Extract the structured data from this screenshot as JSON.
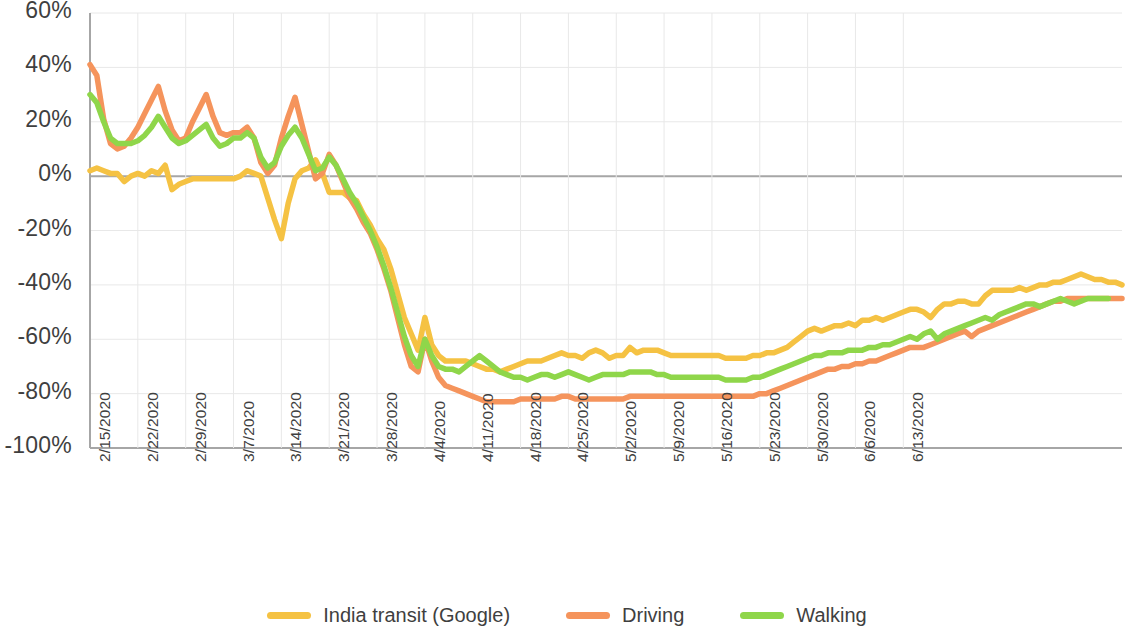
{
  "chart_data": {
    "type": "line",
    "title": "",
    "subtitle": "",
    "xlabel": "",
    "ylabel": "",
    "ylim": [
      -100,
      60
    ],
    "ytick_step": 20,
    "ytick_labels": [
      "60%",
      "40%",
      "20%",
      "0%",
      "-20%",
      "-40%",
      "-60%",
      "-80%",
      "-100%"
    ],
    "ytick_values": [
      60,
      40,
      20,
      0,
      -20,
      -40,
      -60,
      -80,
      -100
    ],
    "grid": true,
    "grid_color": "#e8e8e8",
    "zero_line_color": "#a6a6a6",
    "axis_color": "#a6a6a6",
    "legend_position": "bottom",
    "x_start_date": "2/15/2020",
    "x_end_date": "6/18/2020",
    "xtick_interval_days": 7,
    "xtick_labels": [
      "2/15/2020",
      "2/22/2020",
      "2/29/2020",
      "3/7/2020",
      "3/14/2020",
      "3/21/2020",
      "3/28/2020",
      "4/4/2020",
      "4/11/2020",
      "4/18/2020",
      "4/25/2020",
      "5/2/2020",
      "5/9/2020",
      "5/16/2020",
      "5/23/2020",
      "5/30/2020",
      "6/6/2020",
      "6/13/2020"
    ],
    "series": [
      {
        "name": "India transit (Google)",
        "color": "#F5C243",
        "values": [
          2,
          3,
          2,
          1,
          1,
          -2,
          0,
          1,
          0,
          2,
          1,
          4,
          -5,
          -3,
          -2,
          -1,
          -1,
          -1,
          -1,
          -1,
          -1,
          -1,
          0,
          2,
          1,
          0,
          -8,
          -16,
          -23,
          -10,
          -1,
          2,
          3,
          6,
          1,
          -6,
          -6,
          -6,
          -8,
          -9,
          -14,
          -18,
          -23,
          -27,
          -34,
          -43,
          -52,
          -58,
          -64,
          -52,
          -62,
          -66,
          -68,
          -68,
          -68,
          -68,
          -69,
          -70,
          -71,
          -71,
          -72,
          -71,
          -70,
          -69,
          -68,
          -68,
          -68,
          -67,
          -66,
          -65,
          -66,
          -66,
          -67,
          -65,
          -64,
          -65,
          -67,
          -66,
          -66,
          -63,
          -65,
          -64,
          -64,
          -64,
          -65,
          -66,
          -66,
          -66,
          -66,
          -66,
          -66,
          -66,
          -66,
          -67,
          -67,
          -67,
          -67,
          -66,
          -66,
          -65,
          -65,
          -64,
          -63,
          -61,
          -59,
          -57,
          -56,
          -57,
          -56,
          -55,
          -55,
          -54,
          -55,
          -53,
          -53,
          -52,
          -53,
          -52,
          -51,
          -50,
          -49,
          -49,
          -50,
          -52,
          -49,
          -47,
          -47,
          -46,
          -46,
          -47,
          -47,
          -44,
          -42,
          -42,
          -42,
          -42,
          -41,
          -42,
          -41,
          -40,
          -40,
          -39,
          -39,
          -38,
          -37,
          -36,
          -37,
          -38,
          -38,
          -39,
          -39,
          -40
        ]
      },
      {
        "name": "Driving",
        "color": "#F5945C",
        "values": [
          41,
          37,
          21,
          12,
          10,
          11,
          14,
          18,
          23,
          28,
          33,
          24,
          17,
          13,
          14,
          20,
          25,
          30,
          22,
          16,
          15,
          16,
          16,
          18,
          14,
          5,
          1,
          4,
          14,
          22,
          29,
          19,
          9,
          -1,
          1,
          8,
          4,
          -2,
          -8,
          -12,
          -17,
          -21,
          -27,
          -34,
          -42,
          -52,
          -62,
          -70,
          -72,
          -60,
          -68,
          -74,
          -77,
          -78,
          -79,
          -80,
          -81,
          -82,
          -83,
          -83,
          -83,
          -83,
          -83,
          -82,
          -82,
          -82,
          -82,
          -82,
          -82,
          -81,
          -81,
          -82,
          -82,
          -82,
          -82,
          -82,
          -82,
          -82,
          -82,
          -81,
          -81,
          -81,
          -81,
          -81,
          -81,
          -81,
          -81,
          -81,
          -81,
          -81,
          -81,
          -81,
          -81,
          -81,
          -81,
          -81,
          -81,
          -81,
          -80,
          -80,
          -79,
          -78,
          -77,
          -76,
          -75,
          -74,
          -73,
          -72,
          -71,
          -71,
          -70,
          -70,
          -69,
          -69,
          -68,
          -68,
          -67,
          -66,
          -65,
          -64,
          -63,
          -63,
          -63,
          -62,
          -61,
          -60,
          -59,
          -58,
          -57,
          -59,
          -57,
          -56,
          -55,
          -54,
          -53,
          -52,
          -51,
          -50,
          -49,
          -48,
          -47,
          -46,
          -46,
          -45,
          -45,
          -45,
          -45,
          -45,
          -45,
          -45,
          -45,
          -45
        ]
      },
      {
        "name": "Walking",
        "color": "#8FD64A",
        "values": [
          30,
          27,
          20,
          14,
          12,
          12,
          12,
          13,
          15,
          18,
          22,
          18,
          14,
          12,
          13,
          15,
          17,
          19,
          14,
          11,
          12,
          14,
          14,
          16,
          14,
          7,
          3,
          5,
          11,
          15,
          18,
          14,
          8,
          2,
          3,
          7,
          4,
          -1,
          -6,
          -10,
          -15,
          -20,
          -26,
          -33,
          -41,
          -50,
          -59,
          -66,
          -70,
          -60,
          -66,
          -70,
          -71,
          -71,
          -72,
          -70,
          -68,
          -66,
          -68,
          -70,
          -72,
          -73,
          -74,
          -74,
          -75,
          -74,
          -73,
          -73,
          -74,
          -73,
          -72,
          -73,
          -74,
          -75,
          -74,
          -73,
          -73,
          -73,
          -73,
          -72,
          -72,
          -72,
          -72,
          -73,
          -73,
          -74,
          -74,
          -74,
          -74,
          -74,
          -74,
          -74,
          -74,
          -75,
          -75,
          -75,
          -75,
          -74,
          -74,
          -73,
          -72,
          -71,
          -70,
          -69,
          -68,
          -67,
          -66,
          -66,
          -65,
          -65,
          -65,
          -64,
          -64,
          -64,
          -63,
          -63,
          -62,
          -62,
          -61,
          -60,
          -59,
          -60,
          -58,
          -57,
          -60,
          -58,
          -57,
          -56,
          -55,
          -54,
          -53,
          -52,
          -53,
          -51,
          -50,
          -49,
          -48,
          -47,
          -47,
          -48,
          -47,
          -46,
          -45,
          -46,
          -47,
          -46,
          -45,
          -45,
          -45,
          -45
        ]
      }
    ]
  },
  "legend": {
    "items": [
      {
        "label": "India transit (Google)",
        "color": "#F5C243"
      },
      {
        "label": "Driving",
        "color": "#F5945C"
      },
      {
        "label": "Walking",
        "color": "#8FD64A"
      }
    ]
  }
}
